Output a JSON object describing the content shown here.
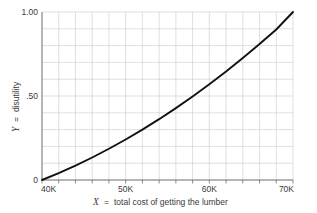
{
  "chart_data": {
    "type": "line",
    "title": "",
    "subtitle": "",
    "xlabel_var": "X",
    "xlabel_eq": "=",
    "xlabel_text": "total cost of getting the lumber",
    "xlabel_full": "X = total cost of getting the lumber",
    "ylabel_var": "Y",
    "ylabel_eq": "=",
    "ylabel_text": "disutility",
    "ylabel_full": "Y = disutility",
    "xlim": [
      40000,
      70000
    ],
    "ylim": [
      0,
      1.0
    ],
    "xtick_labels": [
      "40K",
      "50K",
      "60K",
      "70K"
    ],
    "xtick_values": [
      40000,
      50000,
      60000,
      70000
    ],
    "ytick_labels": [
      "0",
      ".50",
      "1.00"
    ],
    "ytick_values": [
      0,
      0.5,
      1.0
    ],
    "grid": true,
    "grid_columns": 15,
    "grid_rows": 10,
    "grid_color": "#c9c9c9",
    "legend": "none",
    "line_color": "#111111",
    "line_width": 1.9,
    "x": [
      40000,
      42000,
      44000,
      46000,
      48000,
      50000,
      52000,
      54000,
      56000,
      58000,
      60000,
      62000,
      64000,
      66000,
      68000,
      70000
    ],
    "y": [
      0.0,
      0.041,
      0.086,
      0.134,
      0.186,
      0.241,
      0.3,
      0.362,
      0.428,
      0.497,
      0.57,
      0.646,
      0.726,
      0.809,
      0.896,
      1.0
    ],
    "annotations": []
  },
  "colors": {
    "background": "#ffffff",
    "axis": "#6f6f6f",
    "grid": "#c9c9c9",
    "curve": "#111111",
    "text": "#3a3a3a"
  }
}
